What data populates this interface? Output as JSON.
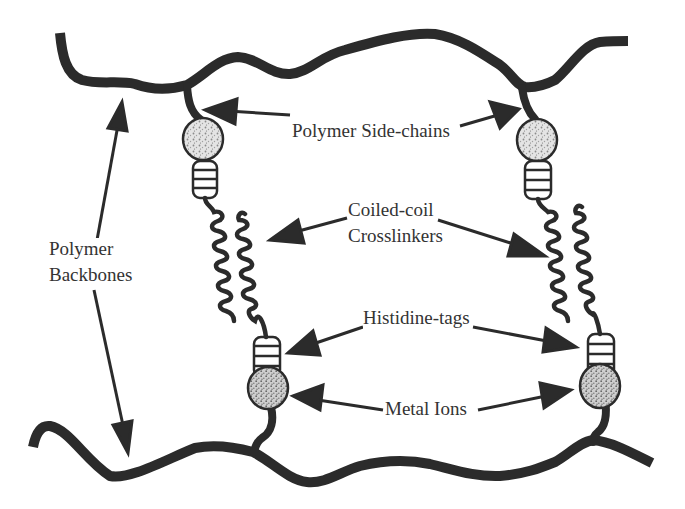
{
  "diagram": {
    "type": "schematic",
    "colors": {
      "stroke": "#2b2b2b",
      "label": "#333333",
      "bead_fill": "#d9d9d9",
      "background": "#ffffff"
    },
    "labels": {
      "backbones_line1": "Polymer",
      "backbones_line2": "Backbones",
      "side_chains": "Polymer Side-chains",
      "coiled_coil_line1": "Coiled-coil",
      "coiled_coil_line2": "Crosslinkers",
      "histidine_tags": "Histidine-tags",
      "metal_ions": "Metal Ions"
    },
    "components": [
      {
        "name": "Polymer Backbones",
        "count": 2,
        "positions": [
          "top",
          "bottom"
        ]
      },
      {
        "name": "Polymer Side-chains",
        "count": 2
      },
      {
        "name": "Coiled-coil Crosslinkers",
        "count": 2
      },
      {
        "name": "Histidine-tags",
        "count": 4
      },
      {
        "name": "Metal Ions",
        "count": 4
      }
    ]
  }
}
